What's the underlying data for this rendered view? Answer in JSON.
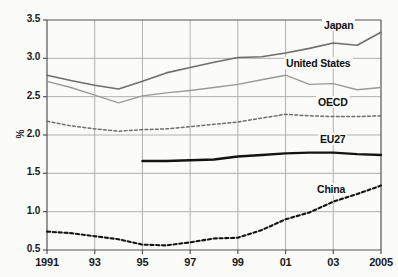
{
  "chart_data": {
    "type": "line",
    "title": "",
    "subtitle": "",
    "xlabel": "",
    "ylabel": "%",
    "x": [
      1991,
      1992,
      1993,
      1994,
      1995,
      1996,
      1997,
      1998,
      1999,
      2000,
      2001,
      2002,
      2003,
      2004,
      2005
    ],
    "tick_labels_x": [
      "1991",
      "93",
      "95",
      "97",
      "99",
      "01",
      "03",
      "2005"
    ],
    "tick_values_x": [
      1991,
      1993,
      1995,
      1997,
      1999,
      2001,
      2003,
      2005
    ],
    "tick_labels_y": [
      "0.5",
      "1.0",
      "1.5",
      "2.0",
      "2.5",
      "3.0",
      "3.5"
    ],
    "tick_values_y": [
      0.5,
      1.0,
      1.5,
      2.0,
      2.5,
      3.0,
      3.5
    ],
    "ylim": [
      0.5,
      3.5
    ],
    "xlim": [
      1991,
      2005
    ],
    "grid": true,
    "legend_position": "inline-right",
    "series": [
      {
        "name": "Japan",
        "style": "solid",
        "color": "#6e6e6e",
        "width": 1.6,
        "values": [
          2.78,
          2.71,
          2.65,
          2.6,
          2.7,
          2.81,
          2.88,
          2.95,
          3.01,
          3.02,
          3.07,
          3.13,
          3.2,
          3.17,
          3.34
        ]
      },
      {
        "name": "United States",
        "style": "solid",
        "color": "#9a9a9a",
        "width": 1.4,
        "values": [
          2.7,
          2.62,
          2.52,
          2.42,
          2.51,
          2.55,
          2.58,
          2.62,
          2.66,
          2.72,
          2.78,
          2.66,
          2.67,
          2.59,
          2.62
        ]
      },
      {
        "name": "OECD",
        "style": "dashed",
        "color": "#6e6e6e",
        "width": 1.5,
        "values": [
          2.18,
          2.12,
          2.08,
          2.05,
          2.07,
          2.08,
          2.11,
          2.14,
          2.17,
          2.22,
          2.27,
          2.25,
          2.24,
          2.24,
          2.25
        ]
      },
      {
        "name": "EU27",
        "style": "solid",
        "color": "#141414",
        "width": 2.4,
        "values": [
          null,
          null,
          null,
          null,
          1.66,
          1.66,
          1.67,
          1.68,
          1.72,
          1.74,
          1.76,
          1.77,
          1.77,
          1.75,
          1.74
        ]
      },
      {
        "name": "China",
        "style": "dashed",
        "color": "#141414",
        "width": 2.1,
        "values": [
          0.74,
          0.72,
          0.68,
          0.64,
          0.57,
          0.56,
          0.6,
          0.65,
          0.66,
          0.76,
          0.9,
          0.99,
          1.13,
          1.23,
          1.34
        ]
      }
    ]
  },
  "axis": {
    "y_title": "%",
    "y_ticks": [
      "3.5",
      "3.0",
      "2.5",
      "2.0",
      "1.5",
      "1.0",
      "0.5"
    ],
    "x_ticks": [
      "1991",
      "93",
      "95",
      "97",
      "99",
      "01",
      "03",
      "2005"
    ]
  },
  "series_labels": [
    {
      "text": "Japan",
      "x": 322,
      "y": 19
    },
    {
      "text": "United States",
      "x": 284,
      "y": 57
    },
    {
      "text": "OECD",
      "x": 316,
      "y": 96
    },
    {
      "text": "EU27",
      "x": 318,
      "y": 133
    },
    {
      "text": "China",
      "x": 315,
      "y": 183
    }
  ],
  "colors": {
    "background": "#fbfbfa",
    "grid": "#a8a8a8",
    "axis": "#555555",
    "text": "#1a1a1a",
    "japan": "#6e6e6e",
    "united_states": "#9a9a9a",
    "oecd": "#6e6e6e",
    "eu27": "#141414",
    "china": "#141414"
  }
}
